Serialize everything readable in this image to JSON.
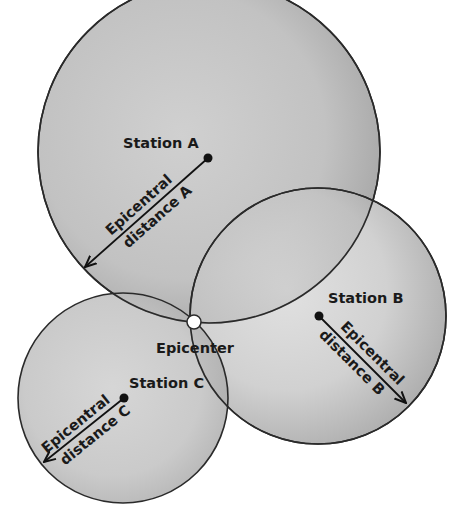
{
  "diagram": {
    "colors": {
      "background": "#ffffff",
      "circle_fill_center": "#d2d2d2",
      "circle_fill_edge": "#a8a8a8",
      "stroke": "#2a2a2a",
      "epicenter_fill": "#ffffff"
    },
    "stations": [
      {
        "id": "A",
        "label": "Station A",
        "cx": 209,
        "cy": 152,
        "r": 171,
        "dot": [
          208,
          158
        ],
        "arrow_end": [
          84,
          268
        ],
        "distance_line1": "Epicentral",
        "distance_line2": "distance A"
      },
      {
        "id": "B",
        "label": "Station B",
        "cx": 318,
        "cy": 316,
        "r": 128,
        "dot": [
          319,
          316
        ],
        "arrow_end": [
          407,
          404
        ],
        "distance_line1": "Epicentral",
        "distance_line2": "distance B"
      },
      {
        "id": "C",
        "label": "Station C",
        "cx": 123,
        "cy": 398,
        "r": 105,
        "dot": [
          124,
          398
        ],
        "arrow_end": [
          43,
          463
        ],
        "distance_line1": "Epicentral",
        "distance_line2": "distance C"
      }
    ],
    "epicenter": {
      "label": "Epicenter",
      "x": 194,
      "y": 322
    }
  }
}
